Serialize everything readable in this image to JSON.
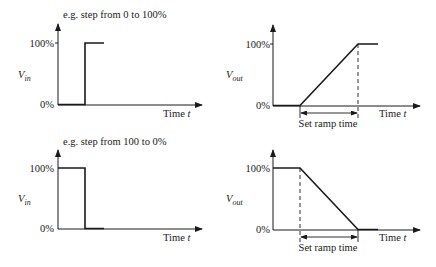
{
  "panels": [
    {
      "id": "input-step-up",
      "caption": "e.g. step from 0 to 100%",
      "ylabel_main": "V",
      "ylabel_sub": "in",
      "y_tick_high": "100%",
      "y_tick_low": "0%",
      "xlabel_main": "Time ",
      "xlabel_var": "t"
    },
    {
      "id": "output-ramp-up",
      "ylabel_main": "V",
      "ylabel_sub": "out",
      "y_tick_high": "100%",
      "y_tick_low": "0%",
      "xlabel_main": "Time ",
      "xlabel_var": "t",
      "ramp_label": "Set ramp time"
    },
    {
      "id": "input-step-down",
      "caption": "e.g. step from 100 to 0%",
      "ylabel_main": "V",
      "ylabel_sub": "in",
      "y_tick_high": "100%",
      "y_tick_low": "0%",
      "xlabel_main": "Time ",
      "xlabel_var": "t"
    },
    {
      "id": "output-ramp-down",
      "ylabel_main": "V",
      "ylabel_sub": "out",
      "y_tick_high": "100%",
      "y_tick_low": "0%",
      "xlabel_main": "Time ",
      "xlabel_var": "t",
      "ramp_label": "Set ramp time"
    }
  ],
  "colors": {
    "ink": "#1a1a1a",
    "background": "#ffffff"
  }
}
